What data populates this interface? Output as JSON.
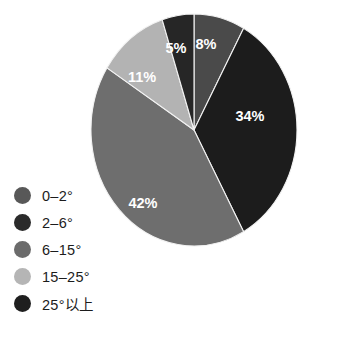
{
  "chart_data": {
    "type": "pie",
    "title": "",
    "subtitle": "",
    "xlabel": "",
    "ylabel": "",
    "grid": false,
    "legend_position": "bottom-left",
    "start_angle_deg": 0,
    "direction": "clockwise",
    "units": "percent",
    "categories": [
      "2-6°",
      "25°以上",
      "6-15°",
      "15-25°",
      "0-2°"
    ],
    "values": [
      8,
      34,
      42,
      11,
      5
    ],
    "slices": [
      {
        "label": "8%",
        "value": 8,
        "category": "2-6°",
        "color": "#4a4a4a",
        "label_x": 118,
        "label_y": 33
      },
      {
        "label": "34%",
        "value": 34,
        "category": "25°以上",
        "color": "#1c1c1c",
        "label_x": 162,
        "label_y": 105
      },
      {
        "label": "42%",
        "value": 42,
        "category": "6-15°",
        "color": "#6e6e6e",
        "label_x": 55,
        "label_y": 192
      },
      {
        "label": "11%",
        "value": 11,
        "category": "15-25°",
        "color": "#b3b3b3",
        "label_x": 54,
        "label_y": 66
      },
      {
        "label": "5%",
        "value": 5,
        "category": "0-2°",
        "color": "#262626",
        "label_x": 88,
        "label_y": 37
      }
    ]
  },
  "legend": {
    "items": [
      {
        "label": "0–2°",
        "color": "#585858",
        "swatch_name": "legend-swatch-0-2"
      },
      {
        "label": "2–6°",
        "color": "#2b2b2b",
        "swatch_name": "legend-swatch-2-6"
      },
      {
        "label": "6–15°",
        "color": "#6b6b6b",
        "swatch_name": "legend-swatch-6-15"
      },
      {
        "label": "15–25°",
        "color": "#b5b5b5",
        "swatch_name": "legend-swatch-15-25"
      },
      {
        "label": "25°以上",
        "color": "#1f1f1f",
        "swatch_name": "legend-swatch-25-above"
      }
    ]
  },
  "colors": {
    "background": "#ffffff",
    "text": "#1c1c1c",
    "label_text": "#ffffff",
    "slice_edge": "#f2f2f2"
  }
}
